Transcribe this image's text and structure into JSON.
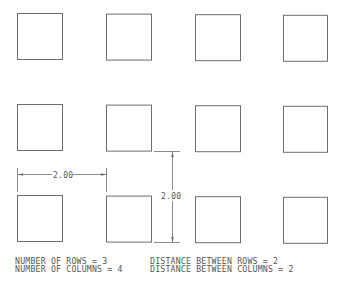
{
  "diagram": {
    "array": {
      "rows": 3,
      "columns": 4,
      "item_shape": "square"
    },
    "dimensions": {
      "horizontal": {
        "label": "2.00",
        "measures": "distance-between-columns"
      },
      "vertical": {
        "label": "2.00",
        "measures": "distance-between-rows"
      }
    },
    "notes": {
      "rows_line": "NUMBER OF ROWS = 3",
      "columns_line": "NUMBER OF COLUMNS = 4",
      "row_distance_line": "DISTANCE BETWEEN ROWS = 2",
      "column_distance_line": "DISTANCE BETWEEN COLUMNS = 2"
    },
    "colors": {
      "line": "#6e6e6e",
      "text": "#555555",
      "background": "#ffffff"
    }
  }
}
